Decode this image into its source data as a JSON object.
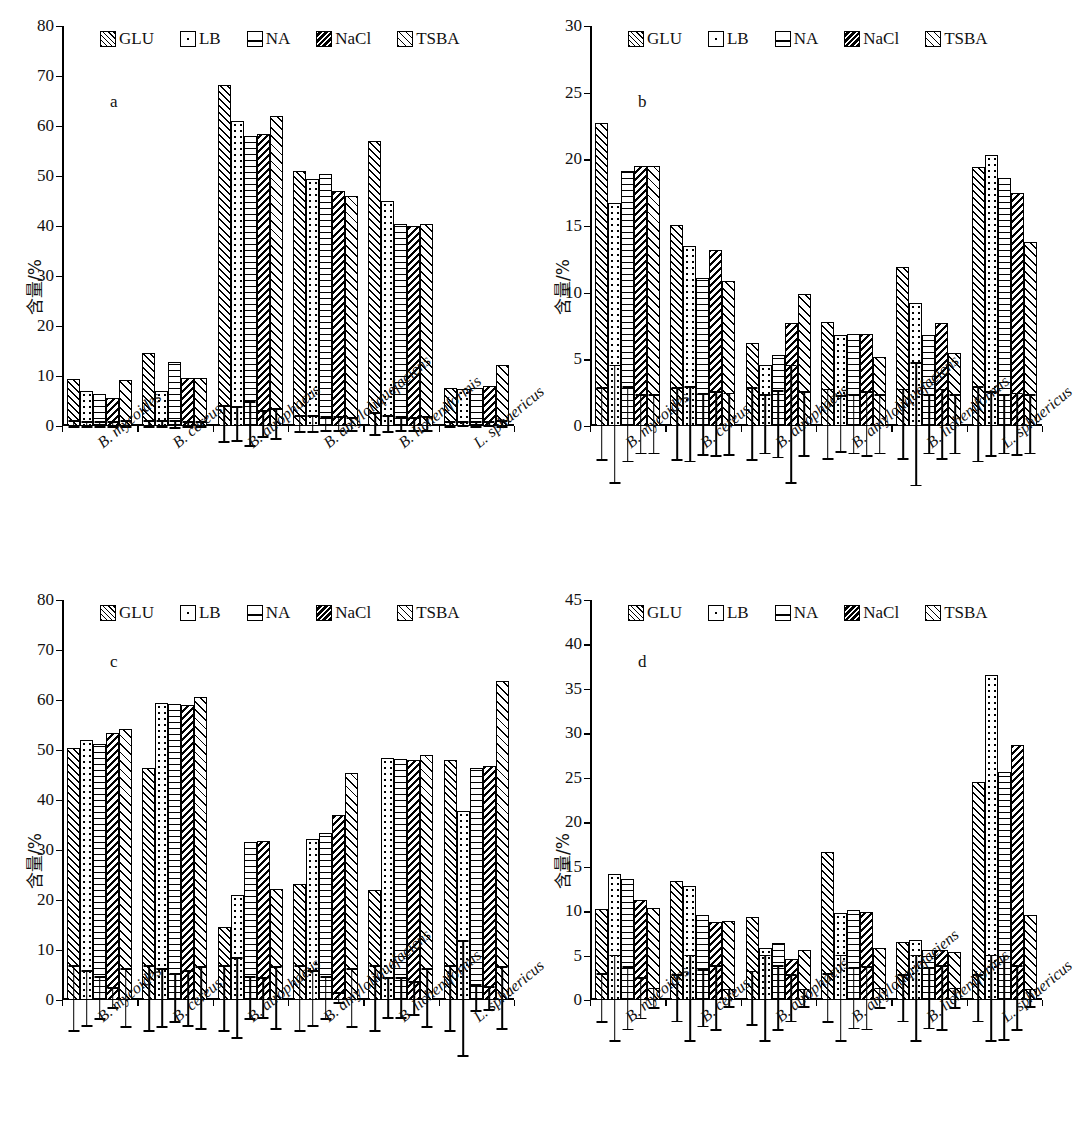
{
  "figure": {
    "ylabel": "含量/%",
    "categories": [
      "B. mycoides",
      "B. cereus",
      "B. atrophaeus",
      "B. amyloliquefaciens",
      "B. licheniformis",
      "L. sphaericus"
    ],
    "series_names": [
      "GLU",
      "LB",
      "NA",
      "NaCl",
      "TSBA"
    ],
    "legend": [
      {
        "label": "GLU",
        "pattern": "diagonal-hatch"
      },
      {
        "label": "LB",
        "pattern": "dotted"
      },
      {
        "label": "NA",
        "pattern": "horizontal-lines"
      },
      {
        "label": "NaCl",
        "pattern": "dense-back-diagonal"
      },
      {
        "label": "TSBA",
        "pattern": "crosshatch"
      }
    ]
  },
  "chart_data": [
    {
      "id": "a",
      "type": "bar",
      "panel_letter": "a",
      "title": "",
      "xlabel": "",
      "ylabel": "含量/%",
      "ylim": [
        0,
        80
      ],
      "yticks": [
        0,
        10,
        20,
        30,
        40,
        50,
        60,
        70,
        80
      ],
      "grid": false,
      "legend_position": "top",
      "categories": [
        "B. mycoides",
        "B. cereus",
        "B. atrophaeus",
        "B. amyloliquefaciens",
        "B. licheniformis",
        "L. sphaericus"
      ],
      "series": [
        {
          "name": "GLU",
          "values": [
            9.4,
            14.6,
            68.2,
            51.0,
            57.0,
            7.6
          ],
          "errors": [
            0.6,
            0.6,
            3.6,
            1.6,
            2.2,
            0.5
          ]
        },
        {
          "name": "LB",
          "values": [
            7.0,
            7.0,
            61.0,
            49.5,
            45.0,
            7.5
          ],
          "errors": [
            0.5,
            0.6,
            3.4,
            1.6,
            1.6,
            0.4
          ]
        },
        {
          "name": "NA",
          "values": [
            6.4,
            12.8,
            58.0,
            50.5,
            40.5,
            7.6
          ],
          "errors": [
            0.5,
            0.7,
            4.4,
            1.4,
            1.4,
            0.5
          ]
        },
        {
          "name": "NaCl",
          "values": [
            5.6,
            9.6,
            58.4,
            47.0,
            40.0,
            8.0
          ],
          "errors": [
            0.5,
            0.5,
            2.6,
            1.4,
            1.3,
            0.4
          ]
        },
        {
          "name": "TSBA",
          "values": [
            9.2,
            9.6,
            62.0,
            46.0,
            40.5,
            12.2
          ],
          "errors": [
            0.6,
            0.5,
            3.0,
            1.3,
            1.4,
            0.6
          ]
        }
      ]
    },
    {
      "id": "b",
      "type": "bar",
      "panel_letter": "b",
      "title": "",
      "xlabel": "",
      "ylabel": "含量/%",
      "ylim": [
        0,
        30
      ],
      "yticks": [
        0,
        5,
        10,
        15,
        20,
        25,
        30
      ],
      "grid": false,
      "legend_position": "top",
      "categories": [
        "B. mycoides",
        "B. cereus",
        "B. atrophaeus",
        "B. amyloliquefaciens",
        "B. licheniformis",
        "L. sphaericus"
      ],
      "series": [
        {
          "name": "GLU",
          "values": [
            22.7,
            15.1,
            6.2,
            7.8,
            11.9,
            19.4
          ],
          "errors": [
            2.7,
            2.7,
            2.7,
            2.6,
            2.6,
            2.8
          ]
        },
        {
          "name": "LB",
          "values": [
            16.7,
            13.5,
            4.6,
            6.8,
            9.2,
            20.3
          ],
          "errors": [
            4.4,
            2.8,
            2.2,
            2.1,
            4.6,
            2.4
          ]
        },
        {
          "name": "NA",
          "values": [
            19.1,
            11.1,
            5.3,
            6.9,
            6.8,
            18.6
          ],
          "errors": [
            2.8,
            2.3,
            2.5,
            2.2,
            2.2,
            2.2
          ]
        },
        {
          "name": "NaCl",
          "values": [
            19.5,
            13.2,
            7.7,
            6.9,
            7.7,
            17.5
          ],
          "errors": [
            2.2,
            2.4,
            4.4,
            2.4,
            2.6,
            2.3
          ]
        },
        {
          "name": "TSBA",
          "values": [
            19.5,
            10.9,
            9.9,
            5.2,
            5.5,
            13.8
          ],
          "errors": [
            2.2,
            2.3,
            2.4,
            2.2,
            2.2,
            2.2
          ]
        }
      ]
    },
    {
      "id": "c",
      "type": "bar",
      "panel_letter": "c",
      "title": "",
      "xlabel": "",
      "ylabel": "含量/%",
      "ylim": [
        0,
        80
      ],
      "yticks": [
        0,
        10,
        20,
        30,
        40,
        50,
        60,
        70,
        80
      ],
      "grid": false,
      "legend_position": "top",
      "categories": [
        "B. mycoides",
        "B. cereus",
        "B. atrophaeus",
        "B. amyloliquefaciens",
        "B. licheniformis",
        "L. sphaericus"
      ],
      "series": [
        {
          "name": "GLU",
          "values": [
            50.5,
            46.5,
            14.7,
            23.3,
            22.0,
            48.0
          ],
          "errors": [
            6.5,
            6.5,
            6.5,
            6.5,
            6.5,
            6.5
          ]
        },
        {
          "name": "LB",
          "values": [
            52.0,
            59.5,
            21.0,
            32.3,
            48.5,
            37.8
          ],
          "errors": [
            5.5,
            5.8,
            8.0,
            5.5,
            4.0,
            11.5
          ]
        },
        {
          "name": "NA",
          "values": [
            51.3,
            59.2,
            31.6,
            33.5,
            48.3,
            46.5
          ],
          "errors": [
            4.2,
            4.8,
            4.2,
            4.2,
            4.0,
            2.6
          ]
        },
        {
          "name": "NaCl",
          "values": [
            53.5,
            59.0,
            31.8,
            37.0,
            48.0,
            46.8
          ],
          "errors": [
            2.0,
            5.5,
            4.0,
            1.0,
            3.3,
            2.3
          ]
        },
        {
          "name": "TSBA",
          "values": [
            54.2,
            60.7,
            22.3,
            45.5,
            49.0,
            63.8
          ],
          "errors": [
            5.8,
            6.2,
            6.2,
            5.8,
            5.8,
            6.2
          ]
        }
      ]
    },
    {
      "id": "d",
      "type": "bar",
      "panel_letter": "d",
      "title": "",
      "xlabel": "",
      "ylabel": "含量/%",
      "ylim": [
        0,
        45
      ],
      "yticks": [
        0,
        5,
        10,
        15,
        20,
        25,
        30,
        35,
        40,
        45
      ],
      "grid": false,
      "legend_position": "top",
      "categories": [
        "B. mycoides",
        "B. cereus",
        "B. atrophaeus",
        "B. amyloliquefaciens",
        "B. licheniformis",
        "L. sphaericus"
      ],
      "series": [
        {
          "name": "GLU",
          "values": [
            10.2,
            13.4,
            9.3,
            16.6,
            6.5,
            24.5
          ],
          "errors": [
            2.7,
            2.6,
            3.0,
            2.7,
            2.6,
            2.6
          ]
        },
        {
          "name": "LB",
          "values": [
            14.2,
            12.8,
            5.9,
            9.8,
            6.8,
            36.6
          ],
          "errors": [
            4.8,
            4.8,
            4.8,
            4.8,
            4.8,
            4.8
          ]
        },
        {
          "name": "NA",
          "values": [
            13.6,
            9.6,
            6.4,
            10.1,
            5.6,
            25.6
          ],
          "errors": [
            3.5,
            3.2,
            3.6,
            3.4,
            3.4,
            4.7
          ]
        },
        {
          "name": "NaCl",
          "values": [
            11.2,
            8.8,
            4.6,
            9.9,
            5.6,
            28.7
          ],
          "errors": [
            2.3,
            3.6,
            2.6,
            3.5,
            3.6,
            3.6
          ]
        },
        {
          "name": "TSBA",
          "values": [
            10.3,
            8.9,
            5.6,
            5.9,
            5.4,
            9.6
          ],
          "errors": [
            1.1,
            1.0,
            1.0,
            1.1,
            1.1,
            1.0
          ]
        }
      ]
    }
  ]
}
